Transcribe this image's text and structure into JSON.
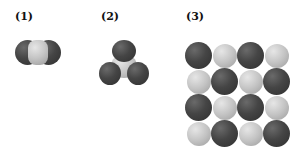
{
  "figure": {
    "panels": [
      {
        "label": "(1)",
        "description": "linear triatomic molecule: dark-light-dark"
      },
      {
        "label": "(2)",
        "description": "trigonal molecule: light center with three dark atoms"
      },
      {
        "label": "(3)",
        "description": "4x4 alternating dark/light atom lattice"
      }
    ],
    "grid_pattern": [
      [
        "dark",
        "light",
        "dark",
        "light"
      ],
      [
        "light",
        "dark",
        "light",
        "dark"
      ],
      [
        "dark",
        "light",
        "dark",
        "light"
      ],
      [
        "light",
        "dark",
        "light",
        "dark"
      ]
    ],
    "colors": {
      "dark_atom": "#3c3c3c",
      "light_atom": "#c4c4c4",
      "background": "#ffffff"
    }
  }
}
